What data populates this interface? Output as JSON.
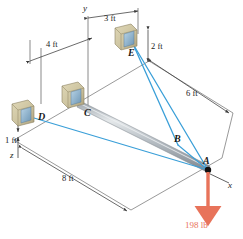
{
  "points": {
    "A": "A",
    "B": "B",
    "C": "C",
    "D": "D",
    "E": "E"
  },
  "axes": {
    "x": "x",
    "y": "y",
    "z": "z"
  },
  "dimensions": {
    "three_ft": "3 ft",
    "four_ft": "4 ft",
    "two_ft": "2 ft",
    "six_ft": "6 ft",
    "one_ft": "1 ft",
    "eight_ft": "8 ft"
  },
  "force": {
    "magnitude": "198 lb"
  },
  "colors": {
    "cable": "#3a9fd8",
    "force": "#e8735a",
    "bar_light": "#c8cdd2",
    "bar_dark": "#8e969e",
    "bracket": "#cfc6a2",
    "bracket_dark": "#a79c78",
    "bracket_hole": "#7fa8c4",
    "line": "#5a5a5a",
    "text": "#1a1a1a"
  }
}
